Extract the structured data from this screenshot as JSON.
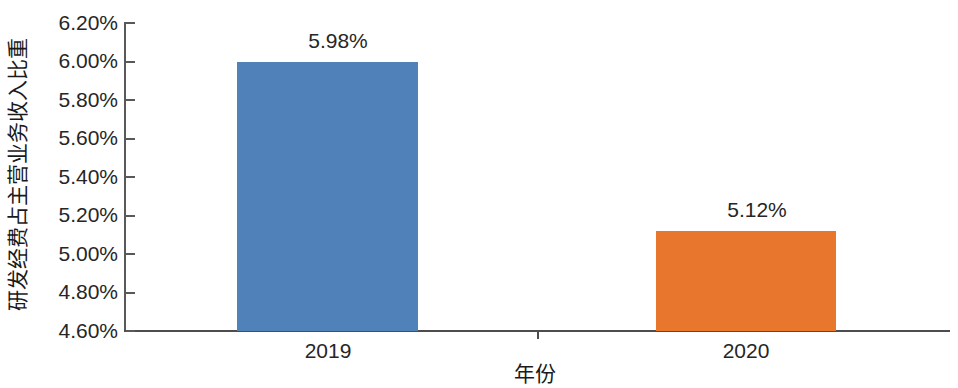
{
  "chart_data": {
    "type": "bar",
    "title": "",
    "xlabel": "年份",
    "ylabel": "研发经费占主营业务收入比重",
    "categories": [
      "2019",
      "2020"
    ],
    "values": [
      5.98,
      5.12
    ],
    "value_labels": [
      "5.98%",
      "5.12%"
    ],
    "series": [
      {
        "name": "研发经费占主营业务收入比重",
        "values": [
          5.98,
          5.12
        ]
      }
    ],
    "ylim": [
      4.6,
      6.2
    ],
    "ytick_step": 0.2,
    "ytick_labels": [
      "6.20%",
      "6.00%",
      "5.80%",
      "5.60%",
      "5.40%",
      "5.20%",
      "5.00%",
      "4.80%",
      "4.60%"
    ],
    "ytick_values": [
      6.2,
      6.0,
      5.8,
      5.6,
      5.4,
      5.2,
      5.0,
      4.8,
      4.6
    ],
    "xtick_labels": [
      "2019",
      "2020"
    ],
    "grid": false,
    "legend": false,
    "legend_position": "none",
    "bar_colors": [
      "#5081B8",
      "#E8762C"
    ],
    "axis_color": "#4d4d4d",
    "text_color": "#262626"
  },
  "axis": {
    "y_title": "研发经费占主营业务收入比重",
    "x_title": "年份",
    "ticks": [
      {
        "label": "6.20%",
        "top": 12
      },
      {
        "label": "6.00%",
        "top": 50
      },
      {
        "label": "5.80%",
        "top": 89
      },
      {
        "label": "5.60%",
        "top": 127
      },
      {
        "label": "5.40%",
        "top": 166
      },
      {
        "label": "5.20%",
        "top": 204
      },
      {
        "label": "5.00%",
        "top": 243
      },
      {
        "label": "4.80%",
        "top": 281
      },
      {
        "label": "4.60%",
        "top": 320
      }
    ]
  },
  "bars": [
    {
      "category": "2019",
      "value_label": "5.98%",
      "color": "#5081B8",
      "height_px": 269
    },
    {
      "category": "2020",
      "value_label": "5.12%",
      "color": "#E8762C",
      "height_px": 100
    }
  ]
}
